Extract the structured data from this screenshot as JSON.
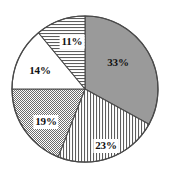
{
  "figure": {
    "background_color": "#ffffff",
    "outline_color": "#4a4a4a",
    "label_text_color": "#111111",
    "center_x": 85,
    "center_y": 89,
    "radius": 73
  },
  "chart_data": {
    "type": "pie",
    "title": "",
    "subtitle": "",
    "xlabel": "",
    "ylabel": "",
    "grid": false,
    "legend": false,
    "legend_position": "none",
    "units": "percent",
    "total": 100,
    "start_angle_deg": 0,
    "direction": "clockwise",
    "categories": [
      "33%",
      "23%",
      "19%",
      "14%",
      "11%"
    ],
    "values": [
      33,
      23,
      19,
      14,
      11
    ],
    "labels": [
      "33%",
      "23%",
      "19%",
      "14%",
      "11%"
    ],
    "slices": [
      {
        "label": "33%",
        "value": 33,
        "fill_style": "solid-gray",
        "fill_color": "#9a9a9a",
        "start_angle_deg": 0,
        "end_angle_deg": 118.8,
        "label_boxed": false,
        "label_x": 118,
        "label_y": 62
      },
      {
        "label": "23%",
        "value": 23,
        "fill_style": "vertical-hatch",
        "fill_color": "#ffffff",
        "start_angle_deg": 118.8,
        "end_angle_deg": 201.6,
        "label_boxed": true,
        "label_x": 106,
        "label_y": 146
      },
      {
        "label": "19%",
        "value": 19,
        "fill_style": "dot-stipple",
        "fill_color": "#ffffff",
        "start_angle_deg": 201.6,
        "end_angle_deg": 270.0,
        "label_boxed": true,
        "label_x": 46,
        "label_y": 122
      },
      {
        "label": "14%",
        "value": 14,
        "fill_style": "plain-white",
        "fill_color": "#ffffff",
        "start_angle_deg": 270.0,
        "end_angle_deg": 320.4,
        "label_boxed": false,
        "label_x": 40,
        "label_y": 70
      },
      {
        "label": "11%",
        "value": 11,
        "fill_style": "horizontal-hatch",
        "fill_color": "#ffffff",
        "start_angle_deg": 320.4,
        "end_angle_deg": 360.0,
        "label_boxed": true,
        "label_x": 72,
        "label_y": 42
      }
    ]
  }
}
